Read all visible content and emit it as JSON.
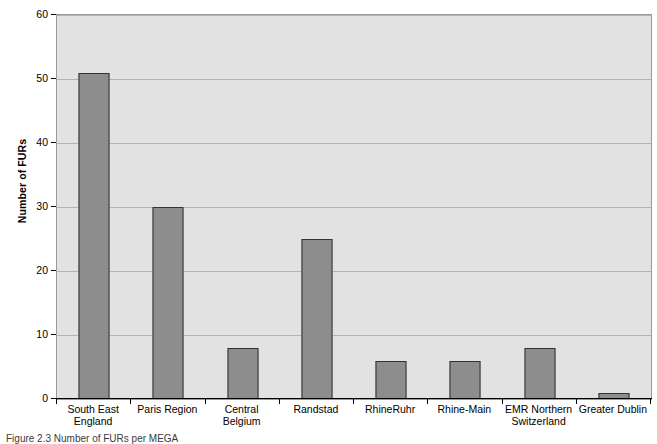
{
  "chart_data": {
    "type": "bar",
    "title": "",
    "xlabel": "",
    "ylabel": "Number of FURs",
    "ylim": [
      0,
      60
    ],
    "yticks": [
      0,
      10,
      20,
      30,
      40,
      50,
      60
    ],
    "grid": true,
    "legend": "none",
    "categories": [
      "South East England",
      "Paris Region",
      "Central Belgium",
      "Randstad",
      "RhineRuhr",
      "Rhine-Main",
      "EMR Northern Switzerland",
      "Greater Dublin"
    ],
    "category_lines": [
      [
        "South East",
        "England"
      ],
      [
        "Paris Region",
        ""
      ],
      [
        "Central Belgium",
        ""
      ],
      [
        "Randstad",
        ""
      ],
      [
        "RhineRuhr",
        ""
      ],
      [
        "Rhine-Main",
        ""
      ],
      [
        "EMR Northern",
        "Switzerland"
      ],
      [
        "Greater Dublin",
        ""
      ]
    ],
    "values": [
      51,
      30,
      8,
      25,
      6,
      6,
      8,
      1
    ]
  },
  "style": {
    "plot_background": "#e2e2e2",
    "bar_fill": "#8d8d8d",
    "bar_border": "#333333",
    "gridline_color": "#b4b4b4",
    "axis_color": "#000000",
    "page_background": "#ffffff"
  },
  "caption": {
    "text": "Figure 2.3 Number of FURs per MEGA"
  }
}
